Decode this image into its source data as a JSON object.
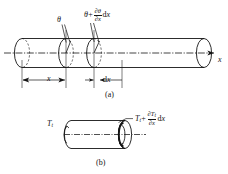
{
  "figure": {
    "title_a": "(a)",
    "title_b": "(b)",
    "labels": {
      "theta": "θ",
      "theta_plus_prefix": "θ",
      "theta_plus_op": "+",
      "theta_num": "∂θ",
      "theta_den": "∂x",
      "theta_dx": "dx",
      "axis_x": "x",
      "dim_x": "x",
      "dim_dx": "dx",
      "torque_left": "T",
      "torque_left_sub": "t",
      "torque_right_prefix": "T",
      "torque_right_sub": "t",
      "torque_right_op": "+",
      "torque_num": "∂T",
      "torque_num_sub": "t",
      "torque_den": "∂x",
      "torque_dx": "dx"
    },
    "colors": {
      "line": "#141414",
      "background": "#ffffff",
      "centerline": "#141414"
    }
  }
}
